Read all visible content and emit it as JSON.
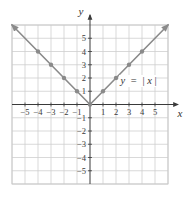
{
  "chart_data": {
    "type": "line",
    "title": "",
    "function_label": {
      "lhs": "y",
      "equals": "=",
      "rhs_open": "|",
      "rhs_var": "x",
      "rhs_close": "|"
    },
    "xlabel": "x",
    "ylabel": "y",
    "xlim": [
      -6,
      6
    ],
    "ylim": [
      -6,
      6
    ],
    "grid": true,
    "x_ticks": [
      -5,
      -4,
      -3,
      -2,
      -1,
      1,
      2,
      3,
      4,
      5
    ],
    "x_tick_labels": [
      "−5",
      "−4",
      "−3",
      "−2",
      "−1",
      "1",
      "2",
      "3",
      "4",
      "5"
    ],
    "y_ticks": [
      5,
      4,
      3,
      2,
      1,
      -1,
      -2,
      -3,
      -4,
      -5
    ],
    "y_tick_labels": [
      "5",
      "4",
      "3",
      "2",
      "1",
      "−1",
      "−2",
      "−3",
      "−4",
      "−5"
    ],
    "series": [
      {
        "name": "y = |x|",
        "color": "#8a8a8a",
        "line": {
          "x": [
            -6,
            -5,
            -4,
            -3,
            -2,
            -1,
            0,
            1,
            2,
            3,
            4,
            5,
            6
          ],
          "y": [
            6,
            5,
            4,
            3,
            2,
            1,
            0,
            1,
            2,
            3,
            4,
            5,
            6
          ]
        },
        "arrow_ends": true,
        "points": {
          "x": [
            -4,
            -3,
            -2,
            -1,
            0,
            1,
            2,
            3,
            4
          ],
          "y": [
            4,
            3,
            2,
            1,
            0,
            1,
            2,
            3,
            4
          ]
        }
      }
    ],
    "colors": {
      "grid": "#cfcfcf",
      "axis": "#3a3a3a",
      "series": "#8a8a8a"
    }
  }
}
